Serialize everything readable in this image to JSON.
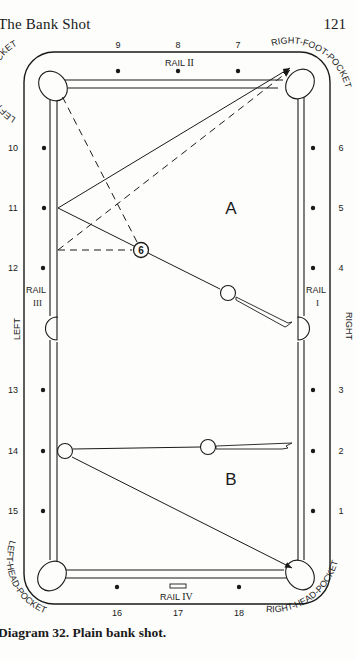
{
  "page": {
    "header_title": "The Bank Shot",
    "page_number": "121",
    "caption": "Diagram 32. Plain bank shot."
  },
  "table": {
    "pockets": {
      "left_foot": "LEFT-FOOT-POCKET",
      "right_foot": "RIGHT-FOOT-POCKET",
      "left_head": "LEFT-HEAD-POCKET",
      "right_head": "RIGHT-HEAD-POCKET"
    },
    "rails": {
      "rail_1": {
        "label": "RAIL",
        "numeral": "I"
      },
      "rail_2": {
        "label": "RAIL",
        "numeral": "II"
      },
      "rail_3": {
        "label": "RAIL",
        "numeral": "III"
      },
      "rail_4": {
        "label": "RAIL",
        "numeral": "IV"
      }
    },
    "sides": {
      "left": "LEFT",
      "right": "RIGHT"
    },
    "diamonds": {
      "top": [
        "9",
        "8",
        "7"
      ],
      "bottom": [
        "16",
        "17",
        "18"
      ],
      "left": [
        "10",
        "11",
        "12",
        "13",
        "14",
        "15"
      ],
      "right": [
        "6",
        "5",
        "4",
        "3",
        "2",
        "1"
      ]
    }
  },
  "shots": {
    "a": {
      "label": "A",
      "object_ball": "6"
    },
    "b": {
      "label": "B"
    }
  },
  "colors": {
    "ink": "#1a1a1a",
    "paper": "#fdfdfb"
  }
}
